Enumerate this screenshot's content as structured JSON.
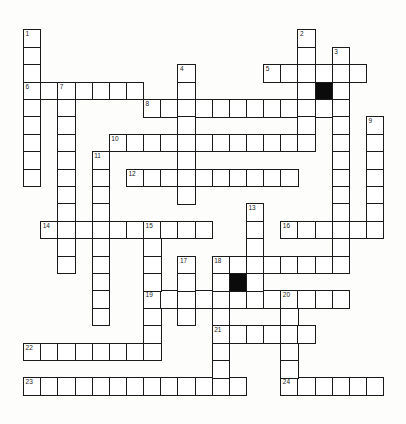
{
  "puzzle": {
    "grid": {
      "origin_x": 23.7,
      "origin_y": 30,
      "cell_w": 17.15,
      "cell_h": 17.4
    },
    "colors": {
      "cell": "#ffffff",
      "border": "#1a1a1a",
      "block": "#0b0b0b",
      "background": "#fdfdfc"
    },
    "across": [
      {
        "number": "5",
        "col": 14,
        "row": 2,
        "length": 6
      },
      {
        "number": "6",
        "col": 0,
        "row": 3,
        "length": 7
      },
      {
        "number": "8",
        "col": 7,
        "row": 4,
        "length": 12
      },
      {
        "number": "10",
        "col": 5,
        "row": 6,
        "length": 12
      },
      {
        "number": "12",
        "col": 6,
        "row": 8,
        "length": 10
      },
      {
        "number": "14",
        "col": 1,
        "row": 11,
        "length": 10
      },
      {
        "number": "16",
        "col": 15,
        "row": 11,
        "length": 6
      },
      {
        "number": "18",
        "col": 11,
        "row": 13,
        "length": 8
      },
      {
        "number": "19",
        "col": 7,
        "row": 15,
        "length": 12
      },
      {
        "number": "21",
        "col": 11,
        "row": 17,
        "length": 6
      },
      {
        "number": "22",
        "col": 0,
        "row": 18,
        "length": 8
      },
      {
        "number": "23",
        "col": 0,
        "row": 20,
        "length": 13
      },
      {
        "number": "24",
        "col": 15,
        "row": 20,
        "length": 6
      }
    ],
    "down": [
      {
        "number": "1",
        "col": 0,
        "row": 0,
        "length": 9
      },
      {
        "number": "2",
        "col": 16,
        "row": 0,
        "length": 7
      },
      {
        "number": "3",
        "col": 18,
        "row": 1,
        "length": 13
      },
      {
        "number": "4",
        "col": 9,
        "row": 2,
        "length": 8
      },
      {
        "number": "7",
        "col": 2,
        "row": 3,
        "length": 11
      },
      {
        "number": "9",
        "col": 20,
        "row": 5,
        "length": 7
      },
      {
        "number": "11",
        "col": 4,
        "row": 7,
        "length": 10
      },
      {
        "number": "13",
        "col": 13,
        "row": 10,
        "length": 6
      },
      {
        "number": "15",
        "col": 7,
        "row": 11,
        "length": 8
      },
      {
        "number": "17",
        "col": 9,
        "row": 13,
        "length": 4
      },
      {
        "number": "18",
        "col": 11,
        "row": 13,
        "length": 8
      },
      {
        "number": "20",
        "col": 15,
        "row": 15,
        "length": 6
      }
    ],
    "blocks": [
      {
        "col": 17,
        "row": 3
      },
      {
        "col": 12,
        "row": 14
      }
    ]
  }
}
